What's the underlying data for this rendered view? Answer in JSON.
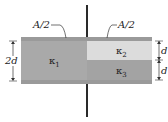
{
  "diagram": {
    "labels": {
      "area_left": "A/2",
      "area_right": "A/2",
      "gap_total": "2d",
      "gap_upper": "d",
      "gap_lower": "d"
    },
    "dielectrics": [
      {
        "symbol": "κ",
        "subscript": "1",
        "region": "left half, full gap 2d"
      },
      {
        "symbol": "κ",
        "subscript": "2",
        "region": "right half, upper d"
      },
      {
        "symbol": "κ",
        "subscript": "3",
        "region": "right half, lower d"
      }
    ],
    "colors": {
      "plate": "#9a9a9a",
      "k1": "#a9a9a9",
      "k2": "#dcdcdc",
      "k3": "#a3a3a3",
      "wire": "#2a2a2a"
    }
  }
}
